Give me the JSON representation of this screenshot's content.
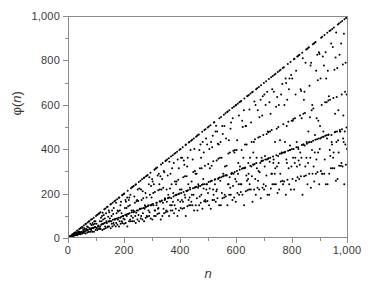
{
  "chart_data": {
    "type": "scatter",
    "title": "",
    "subtitle": "",
    "xlabel": "n",
    "ylabel": "φ(n)",
    "ylabel_symbol": "φ",
    "ylabel_var": "n",
    "xlim": [
      0,
      1000
    ],
    "ylim": [
      0,
      1000
    ],
    "grid": false,
    "legend": null,
    "marker": {
      "shape": "circle",
      "color": "#000000",
      "size_px": 2
    },
    "function": "Euler totient phi(n)",
    "n_points": 1000,
    "x_ticks_major": [
      0,
      200,
      400,
      600,
      800,
      1000
    ],
    "x_ticks_major_labels": [
      "0",
      "200",
      "400",
      "600",
      "800",
      "1,000"
    ],
    "x_ticks_minor": [
      100,
      300,
      500,
      700,
      900
    ],
    "y_ticks_major": [
      0,
      200,
      400,
      600,
      800,
      1000
    ],
    "y_ticks_major_labels": [
      "0",
      "200",
      "400",
      "600",
      "800",
      "1,000"
    ],
    "y_ticks_minor": [
      100,
      300,
      500,
      700,
      900
    ],
    "bands": [
      {
        "name": "primes",
        "slope": 1.0,
        "note": "phi(p) = p - 1, upper envelope"
      },
      {
        "name": "2p",
        "slope": 0.5,
        "note": "dense lower band"
      },
      {
        "name": "3p",
        "slope": 0.6667
      },
      {
        "name": "4p",
        "slope": 0.5
      },
      {
        "name": "6p",
        "slope": 0.3333
      },
      {
        "name": "lowest",
        "slope": 0.24,
        "note": "highly composite n"
      }
    ],
    "x_sample": [
      1,
      2,
      3,
      4,
      5,
      6,
      7,
      8,
      9,
      10,
      11,
      12,
      13,
      14,
      15,
      16,
      17,
      18,
      19,
      20
    ],
    "y_sample": [
      1,
      1,
      2,
      2,
      4,
      2,
      6,
      4,
      6,
      4,
      10,
      4,
      12,
      6,
      8,
      8,
      16,
      6,
      18,
      8
    ]
  },
  "axes": {
    "frame_color": "#8a8a8a",
    "tick_color": "#8a8a8a",
    "text_color": "#3a3a3a",
    "background": "#ffffff"
  }
}
